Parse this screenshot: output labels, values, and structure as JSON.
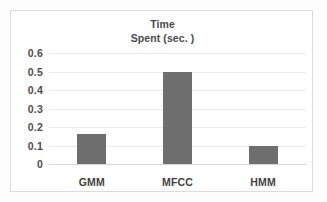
{
  "chart_data": {
    "type": "bar",
    "title": "Time Spent (sec. )",
    "title_lines": [
      "Time",
      "Spent (sec. )"
    ],
    "categories": [
      "GMM",
      "MFCC",
      "HMM"
    ],
    "values": [
      0.16,
      0.5,
      0.097
    ],
    "series": [
      {
        "name": "Time Spent (sec. )",
        "values": [
          0.16,
          0.5,
          0.097
        ],
        "color": "#6e6e6e"
      }
    ],
    "xlabel": "",
    "ylabel": "",
    "ylim": [
      0,
      0.6
    ],
    "ytick_labels": [
      "0",
      "0.1",
      "0.2",
      "0.3",
      "0.4",
      "0.5",
      "0.6"
    ],
    "ytick_values": [
      0,
      0.1,
      0.2,
      0.3,
      0.4,
      0.5,
      0.6
    ],
    "grid": true,
    "legend": false,
    "legend_position": "none",
    "annotations": []
  },
  "style": {
    "bar_color": "#6e6e6e",
    "gridline_color": "#eaeaea",
    "axis_color": "#d6d6d6",
    "frame_color": "#dcdcdc",
    "text_color": "#4a4a4a",
    "background": "#ffffff"
  }
}
